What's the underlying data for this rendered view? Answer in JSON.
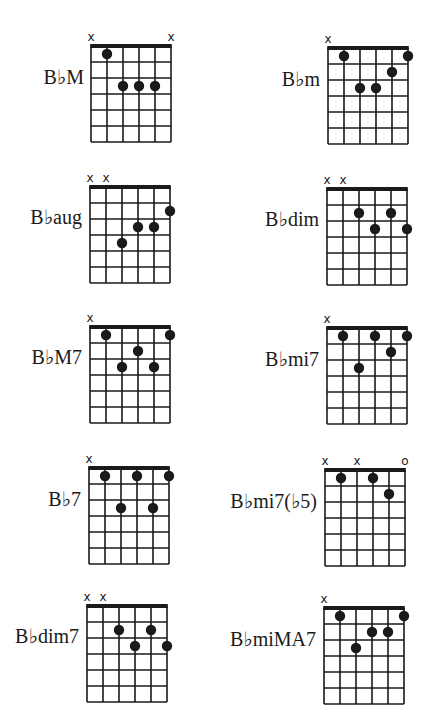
{
  "colors": {
    "ink": "#1a1a1a",
    "background": "#ffffff"
  },
  "diagram_spec": {
    "strings": 6,
    "frets_shown": 6,
    "string_spacing_px": 16,
    "fret_spacing_px": 16
  },
  "chords": [
    {
      "name": "B♭M",
      "grid_x": 90,
      "grid_y": 45,
      "label_right": 84,
      "label_y": 78,
      "markers": [
        {
          "string": 1,
          "type": "x"
        },
        {
          "string": 6,
          "type": "x"
        }
      ],
      "dots": [
        {
          "string": 2,
          "fret": 1
        },
        {
          "string": 3,
          "fret": 3
        },
        {
          "string": 4,
          "fret": 3
        },
        {
          "string": 5,
          "fret": 3
        }
      ]
    },
    {
      "name": "B♭m",
      "grid_x": 327,
      "grid_y": 47,
      "label_right": 320,
      "label_y": 80,
      "markers": [
        {
          "string": 1,
          "type": "x"
        }
      ],
      "dots": [
        {
          "string": 2,
          "fret": 1
        },
        {
          "string": 6,
          "fret": 1
        },
        {
          "string": 5,
          "fret": 2
        },
        {
          "string": 3,
          "fret": 3
        },
        {
          "string": 4,
          "fret": 3
        }
      ]
    },
    {
      "name": "B♭aug",
      "grid_x": 89,
      "grid_y": 186,
      "label_right": 82,
      "label_y": 218,
      "markers": [
        {
          "string": 1,
          "type": "x"
        },
        {
          "string": 2,
          "type": "x"
        }
      ],
      "dots": [
        {
          "string": 6,
          "fret": 2
        },
        {
          "string": 4,
          "fret": 3
        },
        {
          "string": 5,
          "fret": 3
        },
        {
          "string": 3,
          "fret": 4
        }
      ]
    },
    {
      "name": "B♭dim",
      "grid_x": 326,
      "grid_y": 188,
      "label_right": 319,
      "label_y": 220,
      "markers": [
        {
          "string": 1,
          "type": "x"
        },
        {
          "string": 2,
          "type": "x"
        }
      ],
      "dots": [
        {
          "string": 3,
          "fret": 2
        },
        {
          "string": 5,
          "fret": 2
        },
        {
          "string": 4,
          "fret": 3
        },
        {
          "string": 6,
          "fret": 3
        }
      ]
    },
    {
      "name": "B♭M7",
      "grid_x": 89,
      "grid_y": 326,
      "label_right": 82,
      "label_y": 358,
      "markers": [
        {
          "string": 1,
          "type": "x"
        }
      ],
      "dots": [
        {
          "string": 2,
          "fret": 1
        },
        {
          "string": 6,
          "fret": 1
        },
        {
          "string": 4,
          "fret": 2
        },
        {
          "string": 3,
          "fret": 3
        },
        {
          "string": 5,
          "fret": 3
        }
      ]
    },
    {
      "name": "B♭mi7",
      "grid_x": 326,
      "grid_y": 327,
      "label_right": 319,
      "label_y": 360,
      "markers": [
        {
          "string": 1,
          "type": "x"
        }
      ],
      "dots": [
        {
          "string": 2,
          "fret": 1
        },
        {
          "string": 4,
          "fret": 1
        },
        {
          "string": 6,
          "fret": 1
        },
        {
          "string": 5,
          "fret": 2
        },
        {
          "string": 3,
          "fret": 3
        }
      ]
    },
    {
      "name": "B♭7",
      "grid_x": 88,
      "grid_y": 467,
      "label_right": 81,
      "label_y": 500,
      "markers": [
        {
          "string": 1,
          "type": "x"
        }
      ],
      "dots": [
        {
          "string": 2,
          "fret": 1
        },
        {
          "string": 4,
          "fret": 1
        },
        {
          "string": 6,
          "fret": 1
        },
        {
          "string": 3,
          "fret": 3
        },
        {
          "string": 5,
          "fret": 3
        }
      ]
    },
    {
      "name": "B♭mi7(♭5)",
      "grid_x": 324,
      "grid_y": 469,
      "label_right": 317,
      "label_y": 502,
      "markers": [
        {
          "string": 1,
          "type": "x"
        },
        {
          "string": 3,
          "type": "x"
        },
        {
          "string": 6,
          "type": "o"
        }
      ],
      "dots": [
        {
          "string": 2,
          "fret": 1
        },
        {
          "string": 4,
          "fret": 1
        },
        {
          "string": 5,
          "fret": 2
        }
      ]
    },
    {
      "name": "B♭dim7",
      "grid_x": 86,
      "grid_y": 605,
      "label_right": 79,
      "label_y": 637,
      "markers": [
        {
          "string": 1,
          "type": "x"
        },
        {
          "string": 2,
          "type": "x"
        }
      ],
      "dots": [
        {
          "string": 3,
          "fret": 2
        },
        {
          "string": 5,
          "fret": 2
        },
        {
          "string": 4,
          "fret": 3
        },
        {
          "string": 6,
          "fret": 3
        }
      ]
    },
    {
      "name": "B♭miMA7",
      "grid_x": 323,
      "grid_y": 607,
      "label_right": 316,
      "label_y": 640,
      "markers": [
        {
          "string": 1,
          "type": "x"
        }
      ],
      "dots": [
        {
          "string": 2,
          "fret": 1
        },
        {
          "string": 6,
          "fret": 1
        },
        {
          "string": 4,
          "fret": 2
        },
        {
          "string": 5,
          "fret": 2
        },
        {
          "string": 3,
          "fret": 3
        }
      ]
    }
  ]
}
